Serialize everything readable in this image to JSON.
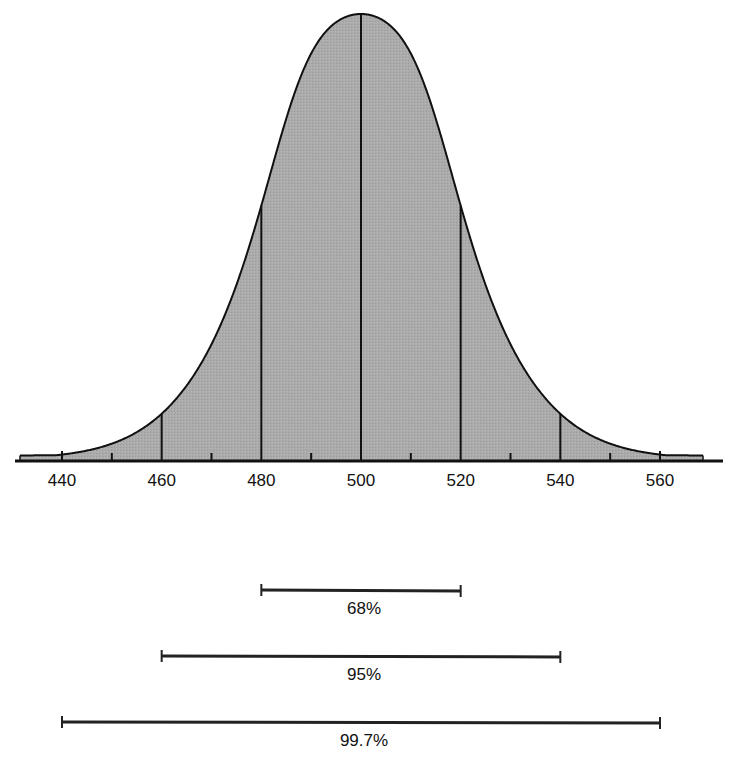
{
  "chart_data": {
    "type": "area",
    "title": "",
    "xlabel": "",
    "ylabel": "",
    "mean": 500,
    "sd": 20,
    "xlim": [
      432,
      568
    ],
    "tick_labels": [
      "440",
      "460",
      "480",
      "500",
      "520",
      "540",
      "560"
    ],
    "major_ticks": [
      440,
      460,
      480,
      500,
      520,
      540,
      560
    ],
    "minor_ticks": [
      450,
      470,
      490,
      510,
      530,
      550
    ],
    "vertical_lines": [
      460,
      480,
      500,
      520,
      540
    ],
    "grid": false,
    "fill_color": "#a9a9a9",
    "line_color": "#111111",
    "ranges": [
      {
        "label": "68%",
        "from": 480,
        "to": 520
      },
      {
        "label": "95%",
        "from": 460,
        "to": 540
      },
      {
        "label": "99.7%",
        "from": 440,
        "to": 560
      }
    ]
  }
}
